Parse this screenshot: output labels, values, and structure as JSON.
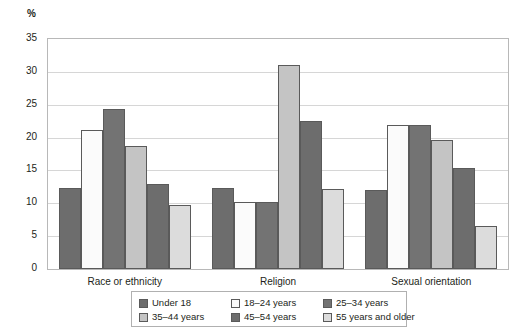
{
  "chart_data": {
    "type": "bar",
    "title": "",
    "subtitle": "",
    "xlabel": "",
    "ylabel": "%",
    "ylim": [
      0,
      35
    ],
    "ytick_step": 5,
    "yticks": [
      "0",
      "5",
      "10",
      "15",
      "20",
      "25",
      "30",
      "35"
    ],
    "grid": true,
    "legend_position": "bottom",
    "categories": [
      "Race or ethnicity",
      "Religion",
      "Sexual orientation"
    ],
    "series": [
      {
        "name": "Under 18",
        "color": "#6d6d6d",
        "values": [
          12.3,
          12.3,
          12.0
        ]
      },
      {
        "name": "18–24 years",
        "color": "#fbfbfb",
        "values": [
          21.2,
          10.2,
          21.9
        ]
      },
      {
        "name": "25–34 years",
        "color": "#737373",
        "values": [
          24.4,
          10.2,
          21.9
        ]
      },
      {
        "name": "35–44 years",
        "color": "#c4c4c4",
        "values": [
          18.7,
          31.0,
          19.7
        ]
      },
      {
        "name": "45–54 years",
        "color": "#6d6d6d",
        "values": [
          12.9,
          22.5,
          15.3
        ]
      },
      {
        "name": "55 years and older",
        "color": "#dcdcdc",
        "values": [
          9.8,
          12.2,
          6.5
        ]
      }
    ]
  },
  "axis": {
    "unit_label": "%"
  },
  "legend": {
    "items": [
      {
        "label": "Under 18"
      },
      {
        "label": "18–24 years"
      },
      {
        "label": "25–34 years"
      },
      {
        "label": "35–44 years"
      },
      {
        "label": "45–54 years"
      },
      {
        "label": "55 years and older"
      }
    ]
  }
}
